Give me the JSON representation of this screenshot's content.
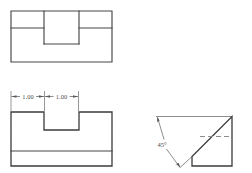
{
  "drawing": {
    "title": "Multiview Orthographic Drawing",
    "line_color": "#474747",
    "hidden_line_color": "#8d8d8d",
    "dimension_color": "#5a5a5a",
    "background": "#ffffff"
  },
  "views": {
    "top": {
      "name": "Top View",
      "description": "Rectangle with rectangular notch at top center"
    },
    "front": {
      "name": "Front View",
      "description": "Block with rectangular slot and base"
    },
    "pictorial": {
      "name": "Right Side View",
      "description": "Block with 45 degree chamfer and hidden edge"
    }
  },
  "dimensions": {
    "left_width": "1.00",
    "right_width": "1.00",
    "angle": "45°"
  }
}
